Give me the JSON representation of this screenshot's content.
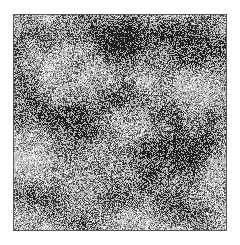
{
  "figure": {
    "kind": "grayscale-speckle-texture",
    "canvas": {
      "width": 240,
      "height": 245,
      "background": "#ffffff"
    },
    "panel": {
      "left": 13,
      "top": 14,
      "width": 214,
      "height": 217,
      "border_color": "#5a5a5a",
      "border_width": 1,
      "base_color": "#b4b4b4"
    },
    "palette": {
      "background": "#ffffff",
      "border": "#5a5a5a",
      "base_gray": "#b4b4b4",
      "mid_gray": "#9a9a9a",
      "dark_gray": "#585858",
      "near_black": "#1e1e1e",
      "light_gray": "#d2d2d2",
      "highlight_white": "#f4f4f4"
    },
    "texture": {
      "type": "clustered-binary-noise",
      "seed": 20240917,
      "pixel_scale": 1,
      "base_level": 180,
      "noise_contrast": 96,
      "dark_fraction": 0.27,
      "light_fraction": 0.18,
      "cluster_blobs": [
        {
          "cx": 0.52,
          "cy": 0.13,
          "rx": 0.16,
          "ry": 0.12,
          "strength": -0.78
        },
        {
          "cx": 0.7,
          "cy": 0.07,
          "rx": 0.2,
          "ry": 0.08,
          "strength": -0.42
        },
        {
          "cx": 0.88,
          "cy": 0.17,
          "rx": 0.14,
          "ry": 0.13,
          "strength": -0.55
        },
        {
          "cx": 0.15,
          "cy": 0.09,
          "rx": 0.13,
          "ry": 0.09,
          "strength": -0.5
        },
        {
          "cx": 0.08,
          "cy": 0.36,
          "rx": 0.12,
          "ry": 0.14,
          "strength": -0.46
        },
        {
          "cx": 0.26,
          "cy": 0.48,
          "rx": 0.15,
          "ry": 0.13,
          "strength": -0.4
        },
        {
          "cx": 0.48,
          "cy": 0.4,
          "rx": 0.13,
          "ry": 0.1,
          "strength": -0.34
        },
        {
          "cx": 0.73,
          "cy": 0.45,
          "rx": 0.12,
          "ry": 0.11,
          "strength": -0.38
        },
        {
          "cx": 0.3,
          "cy": 0.66,
          "rx": 0.14,
          "ry": 0.12,
          "strength": -0.52
        },
        {
          "cx": 0.66,
          "cy": 0.66,
          "rx": 0.17,
          "ry": 0.14,
          "strength": -0.62
        },
        {
          "cx": 0.89,
          "cy": 0.62,
          "rx": 0.11,
          "ry": 0.12,
          "strength": -0.4
        },
        {
          "cx": 0.45,
          "cy": 0.82,
          "rx": 0.15,
          "ry": 0.11,
          "strength": -0.36
        },
        {
          "cx": 0.76,
          "cy": 0.9,
          "rx": 0.14,
          "ry": 0.1,
          "strength": -0.44
        },
        {
          "cx": 0.12,
          "cy": 0.88,
          "rx": 0.13,
          "ry": 0.1,
          "strength": -0.34
        },
        {
          "cx": 0.38,
          "cy": 0.24,
          "rx": 0.1,
          "ry": 0.09,
          "strength": 0.38
        },
        {
          "cx": 0.62,
          "cy": 0.3,
          "rx": 0.12,
          "ry": 0.1,
          "strength": 0.34
        },
        {
          "cx": 0.18,
          "cy": 0.22,
          "rx": 0.09,
          "ry": 0.08,
          "strength": 0.3
        },
        {
          "cx": 0.86,
          "cy": 0.36,
          "rx": 0.1,
          "ry": 0.09,
          "strength": 0.32
        },
        {
          "cx": 0.55,
          "cy": 0.56,
          "rx": 0.1,
          "ry": 0.09,
          "strength": 0.3
        },
        {
          "cx": 0.08,
          "cy": 0.62,
          "rx": 0.09,
          "ry": 0.1,
          "strength": 0.26
        },
        {
          "cx": 0.9,
          "cy": 0.78,
          "rx": 0.1,
          "ry": 0.09,
          "strength": 0.28
        },
        {
          "cx": 0.58,
          "cy": 0.97,
          "rx": 0.12,
          "ry": 0.08,
          "strength": 0.26
        }
      ]
    }
  }
}
